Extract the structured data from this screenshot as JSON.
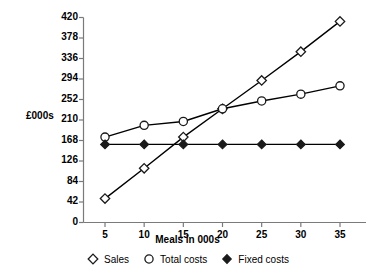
{
  "chart_data": {
    "type": "line",
    "title": "",
    "subtitle": "",
    "xlabel": "Meals in 000s",
    "ylabel": "£000s",
    "x": [
      5,
      10,
      15,
      20,
      25,
      30,
      35
    ],
    "xticklabels": [
      "5",
      "10",
      "15",
      "20",
      "25",
      "30",
      "35"
    ],
    "yticks": [
      0,
      42,
      84,
      126,
      168,
      210,
      252,
      294,
      336,
      378,
      420
    ],
    "yticklabels": [
      "0",
      "42",
      "84",
      "126",
      "168",
      "210",
      "252",
      "294",
      "336",
      "378",
      "420"
    ],
    "xlim": [
      2.5,
      37.5
    ],
    "ylim": [
      0,
      420
    ],
    "grid": false,
    "legend_position": "below",
    "series": [
      {
        "name": "Sales",
        "marker": "open-diamond",
        "color": "#000000",
        "values": [
          49,
          111,
          175,
          233,
          291,
          350,
          412
        ]
      },
      {
        "name": "Total costs",
        "marker": "open-circle",
        "color": "#000000",
        "values": [
          175,
          199,
          207,
          233,
          249,
          263,
          280
        ]
      },
      {
        "name": "Fixed costs",
        "marker": "filled-diamond",
        "color": "#000000",
        "values": [
          160,
          160,
          160,
          160,
          160,
          160,
          160
        ]
      }
    ]
  },
  "legend": {
    "items": [
      {
        "label": "Sales",
        "symbol": "open-diamond"
      },
      {
        "label": "Total costs",
        "symbol": "open-circle"
      },
      {
        "label": "Fixed costs",
        "symbol": "filled-diamond"
      }
    ]
  },
  "colors": {
    "axis": "#7a7a7a",
    "line": "#1a1a1a",
    "text": "#000000",
    "background": "#ffffff"
  }
}
